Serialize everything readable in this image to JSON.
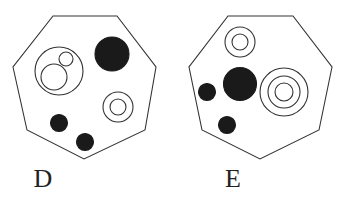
{
  "figures": [
    {
      "label": "D",
      "label_pos": [
        43,
        187
      ],
      "outline": [
        [
          53,
          16
        ],
        [
          117,
          16
        ],
        [
          156,
          67
        ],
        [
          145,
          130
        ],
        [
          84,
          159
        ],
        [
          27,
          130
        ],
        [
          13,
          67
        ]
      ],
      "circles": [
        {
          "name": "large-ring-with-inner-circles",
          "cx": 59,
          "cy": 71,
          "r": 24,
          "fill": "none"
        },
        {
          "name": "inner-small-circle",
          "cx": 66,
          "cy": 59,
          "r": 7,
          "fill": "none"
        },
        {
          "name": "inner-medium-circle",
          "cx": 54,
          "cy": 77,
          "r": 13,
          "fill": "none"
        },
        {
          "name": "filled-large-dot",
          "cx": 112,
          "cy": 54,
          "r": 17,
          "fill": "#1a1a1a"
        },
        {
          "name": "ring-outer",
          "cx": 118,
          "cy": 107,
          "r": 15,
          "fill": "none"
        },
        {
          "name": "ring-inner",
          "cx": 118,
          "cy": 107,
          "r": 8,
          "fill": "none"
        },
        {
          "name": "filled-dot-left",
          "cx": 59,
          "cy": 123,
          "r": 8.5,
          "fill": "#1a1a1a"
        },
        {
          "name": "filled-dot-bottom",
          "cx": 85,
          "cy": 142,
          "r": 8.5,
          "fill": "#1a1a1a"
        }
      ]
    },
    {
      "label": "E",
      "label_pos": [
        233,
        187
      ],
      "outline": [
        [
          228,
          16
        ],
        [
          293,
          16
        ],
        [
          332,
          67
        ],
        [
          319,
          130
        ],
        [
          260,
          159
        ],
        [
          202,
          130
        ],
        [
          189,
          67
        ]
      ],
      "circles": [
        {
          "name": "top-ring-outer",
          "cx": 240,
          "cy": 42,
          "r": 15,
          "fill": "none"
        },
        {
          "name": "top-ring-inner",
          "cx": 240,
          "cy": 42,
          "r": 8,
          "fill": "none"
        },
        {
          "name": "filled-large-dot",
          "cx": 240,
          "cy": 84,
          "r": 16.5,
          "fill": "#1a1a1a"
        },
        {
          "name": "filled-dot-left",
          "cx": 207,
          "cy": 92,
          "r": 8.5,
          "fill": "#1a1a1a"
        },
        {
          "name": "filled-dot-bottom",
          "cx": 227,
          "cy": 125,
          "r": 8.5,
          "fill": "#1a1a1a"
        },
        {
          "name": "triple-ring-outer",
          "cx": 284,
          "cy": 92,
          "r": 24,
          "fill": "none"
        },
        {
          "name": "triple-ring-middle",
          "cx": 284,
          "cy": 92,
          "r": 16,
          "fill": "none"
        },
        {
          "name": "triple-ring-inner",
          "cx": 284,
          "cy": 92,
          "r": 9,
          "fill": "none"
        }
      ]
    }
  ],
  "style": {
    "stroke": "#333333",
    "stroke_width": 1.1,
    "background": "#ffffff"
  }
}
